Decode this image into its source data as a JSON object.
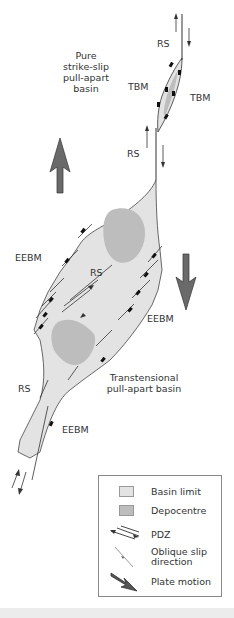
{
  "figure": {
    "title_label": "Pure strike-slip pull-apart basin",
    "title_lines": [
      "Pure",
      "strike-slip",
      "pull-apart",
      "basin"
    ],
    "lower_basin_lines": [
      "Transtensional",
      "pull-apart basin"
    ],
    "labels": {
      "rs_top": "RS",
      "tbm_left": "TBM",
      "tbm_right": "TBM",
      "rs_mid": "RS",
      "eebm_left": "EEBM",
      "rs_inner": "RS",
      "eebm_right": "EEBM",
      "rs_bottom_left": "RS",
      "eebm_bottom": "EEBM"
    },
    "colors": {
      "basin_fill": "#e3e3e3",
      "depocentre_fill": "#bdbdbd",
      "line": "#333333",
      "plate_arrow": "#6a6a6a",
      "marker": "#111111",
      "legend_border": "#888888"
    }
  },
  "legend": {
    "items": [
      {
        "icon": "basin-limit-swatch",
        "label": "Basin limit"
      },
      {
        "icon": "depocentre-swatch",
        "label": "Depocentre"
      },
      {
        "icon": "pdz-arrows-icon",
        "label": "PDZ"
      },
      {
        "icon": "oblique-slip-icon",
        "label": "Oblique slip",
        "label2": "direction"
      },
      {
        "icon": "plate-motion-arrow-icon",
        "label": "Plate motion"
      }
    ]
  }
}
